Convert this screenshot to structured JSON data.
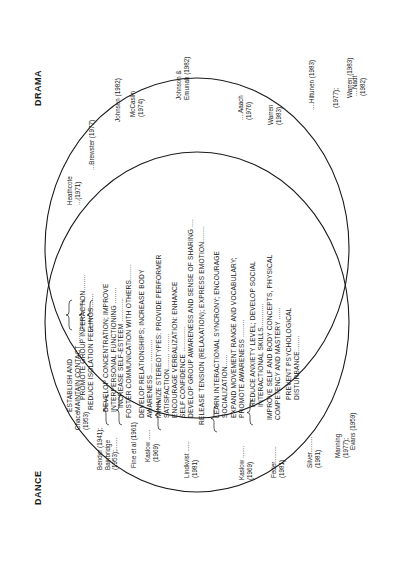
{
  "diagram": {
    "type": "venn",
    "orientation": "rotated-90-ccw",
    "sets": [
      {
        "id": "dance",
        "label": "DANCE"
      },
      {
        "id": "drama",
        "label": "DRAMA"
      }
    ],
    "goals": [
      {
        "lines": [
          "ESTABLISH AND",
          "MAINTAIN CONTACT ........"
        ],
        "dance_refs": [
          "Chace (1953)"
        ],
        "drama_refs": [
          "Heathcote (1971)"
        ]
      },
      {
        "lines": [
          "PROMOTE GROUP INTERACTION........"
        ],
        "dance_refs": [
          "Chace (1953)"
        ],
        "drama_refs": [
          "Brewster (1977)"
        ]
      },
      {
        "lines": [
          "REDUCE ISOLATION FEELINGS......."
        ],
        "dance_refs": [
          "Chace (1953)"
        ],
        "drama_refs": [
          "Brewster (1977)"
        ]
      },
      {
        "lines": [
          "DEVELOP CONCENTRATION; IMPROVE",
          "INTERPERSONAL FUNCTIONING ........"
        ],
        "dance_refs": [
          "Bender (1941);",
          "Bainbridge (1953);"
        ],
        "drama_refs": [
          "Johnson (1982)"
        ]
      },
      {
        "lines": [
          "INCREASE SELF-ESTEEM ............"
        ],
        "dance_refs": [
          "Fine et al (1961)"
        ],
        "drama_refs": [
          "McCaslin (1974)"
        ]
      },
      {
        "lines": [
          "FOSTER COMMUNICATION WITH OTHERS........"
        ],
        "dance_refs": [
          "Kaslow (1969)"
        ],
        "drama_refs": [
          "McCaslin (1974)"
        ]
      },
      {
        "lines": [
          "DEVELOP RELATIONSHIPS; INCREASE BODY",
          "AWARENESS ..... ..........."
        ],
        "dance_refs": [
          "Kaslow (1969)"
        ],
        "drama_refs": [
          "Johnson & Emunah (1982)"
        ]
      },
      {
        "lines": [
          "MINIMIZE STEREOTYPES:  PROVIDE PERFORMER",
          "SATISFACTION........ ........."
        ],
        "dance_refs": [
          "Lindkvist (1981)"
        ],
        "drama_refs": [
          "Johnson & Emunah (1982)"
        ]
      },
      {
        "lines": [
          "ENCOURAGE VERBALIZATION:  ENHANCE",
          "SELF CONFIDENCE ............."
        ],
        "dance_refs": [
          "Lindkvist (1981)"
        ],
        "drama_refs": [
          "Johnson & Emunah (1982)"
        ]
      },
      {
        "lines": [
          "DEVELOP GROUP AWARENESS AND SENSE OF SHARING ...."
        ],
        "dance_refs": [
          "Lindkvist (1981)"
        ],
        "drama_refs": [
          "Johnson & Emunah (1982)"
        ]
      },
      {
        "lines": [
          "RELEASE TENSION (RELAXATION); EXPRESS EMOTION........"
        ],
        "dance_refs": [
          "Kaslow (1969)"
        ],
        "drama_refs": [
          "Aaach (1976)"
        ]
      },
      {
        "lines": [
          "LEARN INTERACTIONAL SYNCRONY; ENCOURAGE",
          "SOCIALIZATION......"
        ],
        "dance_refs": [
          "Kaslow (1969)"
        ],
        "drama_refs": [
          "Warren (1983)"
        ]
      },
      {
        "lines": [
          "EXPAND MOVEMENT RANGE AND VOCABULARY;",
          "PROMOTE AWARENESS ........."
        ],
        "dance_refs": [
          "Feder (1981)"
        ],
        "drama_refs": [
          "Warren (1983)"
        ]
      },
      {
        "lines": [
          "REDUCE ANXIETY LEVEL; DEVELOP SOCIAL",
          "INTERACTIONAL SKILLS............"
        ],
        "dance_refs": [
          "Silver (1981)"
        ],
        "drama_refs": [
          "Hiltunen (1983)"
        ]
      },
      {
        "lines": [
          "IMPROVE SELF AND BODY CONCEPTS, PHYSICAL",
          "COMPETENCY AND MASTERY ......"
        ],
        "dance_refs": [
          "Silver (1981)"
        ],
        "drama_refs": [
          "Brewster (1977);",
          "Warren (1983)"
        ]
      },
      {
        "lines": [
          "PREVENT PSYCHOLOGICAL",
          "DISTURBANCE........"
        ],
        "dance_refs": [
          "Manning (1977);",
          "Evans (1959)"
        ],
        "drama_refs": [
          "Nadt (1982)"
        ]
      }
    ],
    "dance_references": [
      {
        "lines": [
          "Chace",
          "(1953)"
        ]
      },
      {
        "lines": [
          "Bender (1941);",
          "Bainbridge",
          "(1953);......."
        ]
      },
      {
        "lines": [
          "Fine et al (1961)"
        ]
      },
      {
        "lines": [
          "Kaslow ......",
          "(1969)"
        ]
      },
      {
        "lines": [
          "Lindkvist ......",
          "(1981)"
        ]
      },
      {
        "lines": [
          "Kaslow .......",
          "(1969)"
        ]
      },
      {
        "lines": [
          "Feder.........",
          "(1981)"
        ]
      },
      {
        "lines": [
          "Silver.........",
          "(1981)"
        ]
      },
      {
        "lines": [
          "Manning",
          "(1977);"
        ]
      },
      {
        "lines": [
          "Evans (1959)"
        ]
      }
    ],
    "drama_references": [
      {
        "lines": [
          "Heathcote",
          "...(1971)"
        ]
      },
      {
        "lines": [
          "...Brewster (1977)"
        ]
      },
      {
        "lines": [
          "Johnson (1982)"
        ]
      },
      {
        "lines": [
          "McCaslin",
          "(1974)"
        ]
      },
      {
        "lines": [
          "Johnson &",
          "Emunah (1982)"
        ]
      },
      {
        "lines": [
          "....Aaach",
          "(1976)"
        ]
      },
      {
        "lines": [
          "Warren",
          "(1983)"
        ]
      },
      {
        "lines": [
          "....Hiltunen (1983)"
        ]
      },
      {
        "lines": [
          "(1977);"
        ]
      },
      {
        "lines": [
          "Warren (1983)"
        ]
      },
      {
        "lines": [
          "....Nadt",
          "(1982)"
        ]
      }
    ]
  }
}
